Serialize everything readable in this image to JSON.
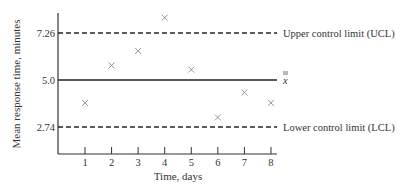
{
  "chart_data": {
    "type": "scatter",
    "title": "",
    "xlabel": "Time, days",
    "ylabel": "Mean response time, minutes",
    "x": [
      1,
      2,
      3,
      4,
      5,
      6,
      7,
      8
    ],
    "series": [
      {
        "name": "Sample means",
        "marker": "x",
        "values": [
          3.9,
          5.7,
          6.4,
          8.0,
          5.5,
          3.2,
          4.4,
          3.9
        ]
      }
    ],
    "x_ticks": [
      "1",
      "2",
      "3",
      "4",
      "5",
      "6",
      "7",
      "8"
    ],
    "y_ticks": [
      "2.74",
      "5.0",
      "7.26"
    ],
    "reference_lines": [
      {
        "name": "ucl",
        "value": 7.26,
        "style": "dashed",
        "label": "Upper control limit (UCL)"
      },
      {
        "name": "center",
        "value": 5.0,
        "style": "solid",
        "label": "x̿"
      },
      {
        "name": "lcl",
        "value": 2.74,
        "style": "dashed",
        "label": "Lower control limit (LCL)"
      }
    ],
    "xlim": [
      0,
      8.5
    ],
    "ylim": [
      1.5,
      8.5
    ],
    "grid": false,
    "legend": "none"
  }
}
